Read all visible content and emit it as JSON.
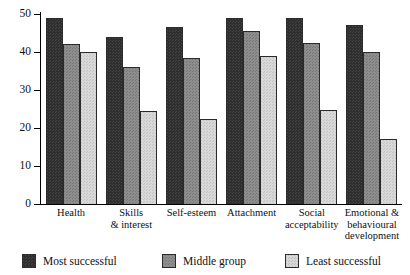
{
  "chart_data": {
    "type": "bar",
    "title": "",
    "xlabel": "",
    "ylabel": "",
    "ylim": [
      0,
      50
    ],
    "yticks": [
      0,
      10,
      20,
      30,
      40,
      50
    ],
    "grid": false,
    "legend_position": "bottom",
    "categories": [
      "Health",
      "Skills\n& interest",
      "Self-esteem",
      "Attachment",
      "Social\nacceptability",
      "Emotional &\nbehavioural\ndevelopment"
    ],
    "category_lines": [
      [
        "Health"
      ],
      [
        "Skills",
        "& interest"
      ],
      [
        "Self-esteem"
      ],
      [
        "Attachment"
      ],
      [
        "Social",
        "acceptability"
      ],
      [
        "Emotional &",
        "behavioural",
        "development"
      ]
    ],
    "series": [
      {
        "name": "Most successful",
        "color": "#2f2f2f",
        "values": [
          49,
          44,
          46.5,
          49,
          49,
          47
        ]
      },
      {
        "name": "Middle group",
        "color": "#8d8d8d",
        "values": [
          42,
          36,
          38.5,
          45.5,
          42.5,
          40
        ]
      },
      {
        "name": "Least successful",
        "color": "#d8d8d8",
        "values": [
          40,
          24.5,
          22.5,
          39,
          24.7,
          17
        ]
      }
    ]
  },
  "axis": {
    "y_tick_labels": [
      "50",
      "40",
      "30",
      "20",
      "10",
      "0"
    ]
  },
  "legend": {
    "items": [
      {
        "label": "Most successful",
        "color": "#2f2f2f"
      },
      {
        "label": "Middle group",
        "color": "#8d8d8d"
      },
      {
        "label": "Least successful",
        "color": "#d8d8d8"
      }
    ]
  }
}
